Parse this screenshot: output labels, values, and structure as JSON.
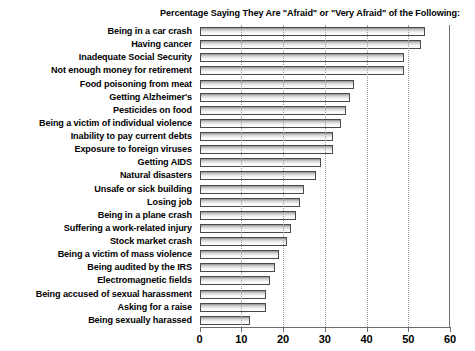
{
  "chart_data": {
    "type": "bar",
    "orientation": "horizontal",
    "title": "Percentage Saying They Are \"Afraid\" or \"Very Afraid\" of the Following:",
    "xlabel": "",
    "ylabel": "",
    "xlim": [
      0,
      60
    ],
    "grid": true,
    "legend": false,
    "xticks": [
      0,
      10,
      20,
      30,
      40,
      50,
      60
    ],
    "xtick_labels": [
      "0",
      "10",
      "20",
      "30",
      "40",
      "50",
      "60"
    ],
    "categories": [
      "Being in a car crash",
      "Having cancer",
      "Inadequate Social Security",
      "Not enough money for retirement",
      "Food poisoning from meat",
      "Getting Alzheimer's",
      "Pesticides on food",
      "Being a victim of individual violence",
      "Inability to pay current debts",
      "Exposure to foreign viruses",
      "Getting AIDS",
      "Natural disasters",
      "Unsafe or sick building",
      "Losing job",
      "Being in a plane crash",
      "Suffering a work-related injury",
      "Stock market crash",
      "Being a victim of mass violence",
      "Being audited by the IRS",
      "Electromagnetic fields",
      "Being accused of sexual harassment",
      "Asking for a raise",
      "Being sexually harassed"
    ],
    "values": [
      54,
      53,
      49,
      49,
      37,
      36,
      35,
      34,
      32,
      32,
      29,
      28,
      25,
      24,
      23,
      22,
      21,
      19,
      18,
      17,
      16,
      16,
      12
    ],
    "bar_fill": "#dcdcdc",
    "bar_edge": "#4a4a4a",
    "gridline_color": "#9a9a9a",
    "axis_color": "#6f6f6f"
  }
}
